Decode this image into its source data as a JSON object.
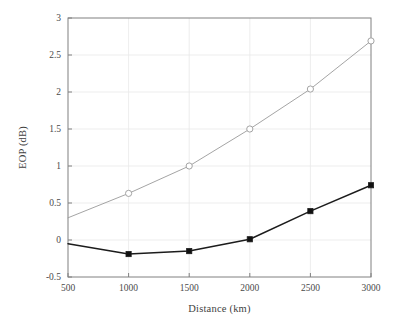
{
  "chart_data": {
    "type": "line",
    "title": "",
    "xlabel": "Distance (km)",
    "ylabel": "EOP (dB)",
    "x": [
      500,
      1000,
      1500,
      2000,
      2500,
      3000
    ],
    "xlim": [
      500,
      3000
    ],
    "ylim": [
      -0.5,
      3
    ],
    "xticks": [
      500,
      1000,
      1500,
      2000,
      2500,
      3000
    ],
    "yticks": [
      -0.5,
      0,
      0.5,
      1,
      1.5,
      2,
      2.5,
      3
    ],
    "xticklabels": [
      "500",
      "1000",
      "1500",
      "2000",
      "2500",
      "3000"
    ],
    "yticklabels": [
      "-0.5",
      "0",
      "0.5",
      "1",
      "1.5",
      "2",
      "2.5",
      "3"
    ],
    "grid": true,
    "grid_color": "#e8e8e8",
    "legend": "none",
    "frame_color": "#808080",
    "series": [
      {
        "name": "upper-curve",
        "values": [
          0.3,
          0.63,
          1.0,
          1.5,
          2.04,
          2.69
        ],
        "color": "#9a9a9a",
        "marker": "open-circle",
        "marker_fill": "#ffffff",
        "line_width": 0.9,
        "marker_size": 3.1,
        "marker_x": [
          1000,
          1500,
          2000,
          2500,
          3000
        ]
      },
      {
        "name": "lower-curve",
        "values": [
          -0.05,
          -0.19,
          -0.15,
          0.01,
          0.39,
          0.74
        ],
        "color": "#1c1c1c",
        "marker": "filled-square",
        "marker_fill": "#111111",
        "line_width": 1.5,
        "marker_size": 2.6,
        "marker_x": [
          1000,
          1500,
          2000,
          2500,
          3000
        ]
      }
    ]
  }
}
